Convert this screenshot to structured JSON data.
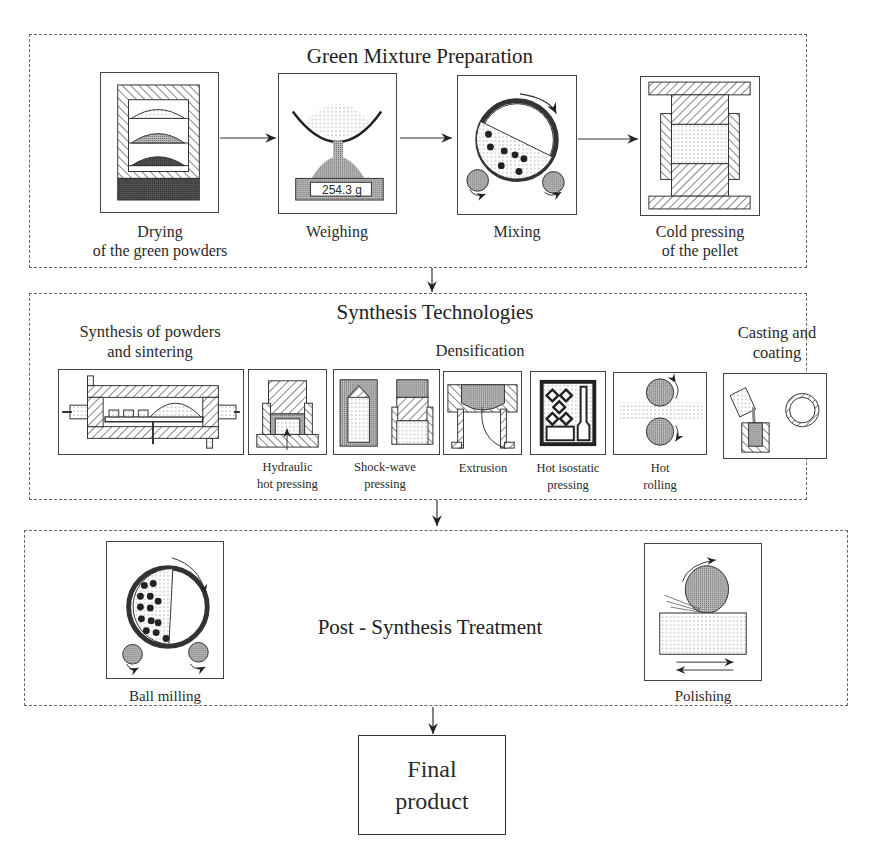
{
  "sections": {
    "green": {
      "title": "Green Mixture Preparation",
      "steps": [
        {
          "label_1": "Drying",
          "label_2": "of the green powders",
          "icon": "drying-oven-icon"
        },
        {
          "label_1": "Weighing",
          "label_2": "",
          "icon": "scale-icon",
          "display_value": "254.3 g"
        },
        {
          "label_1": "Mixing",
          "label_2": "",
          "icon": "mixing-drum-icon"
        },
        {
          "label_1": "Cold pressing",
          "label_2": "of the pellet",
          "icon": "cold-press-icon"
        }
      ]
    },
    "synthesis": {
      "title": "Synthesis Technologies",
      "groups": {
        "sintering": {
          "label_1": "Synthesis of powders",
          "label_2": "and sintering"
        },
        "densification": {
          "label": "Densification"
        },
        "casting": {
          "label_1": "Casting and",
          "label_2": "coating"
        }
      },
      "methods": [
        {
          "label_1": "Hydraulic",
          "label_2": "hot pressing"
        },
        {
          "label_1": "Shock-wave",
          "label_2": "pressing"
        },
        {
          "label_1": "Extrusion",
          "label_2": ""
        },
        {
          "label_1": "Hot isostatic",
          "label_2": "pressing"
        },
        {
          "label_1": "Hot",
          "label_2": "rolling"
        }
      ]
    },
    "post": {
      "title": "Post - Synthesis Treatment",
      "steps": [
        {
          "label": "Ball milling"
        },
        {
          "label": "Polishing"
        }
      ]
    },
    "final": {
      "label_1": "Final",
      "label_2": "product"
    }
  }
}
